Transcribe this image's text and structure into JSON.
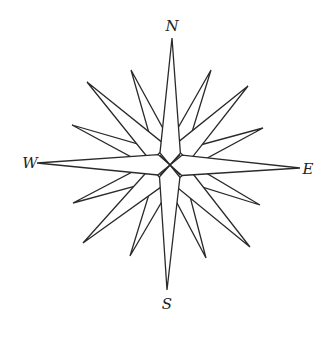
{
  "diagram": {
    "type": "compass-rose",
    "center": [
      170,
      165
    ],
    "labels": {
      "north": "N",
      "south": "S",
      "east": "E",
      "west": "W"
    },
    "label_positions": {
      "north": [
        172,
        31
      ],
      "south": [
        167,
        309
      ],
      "east": [
        308,
        174
      ],
      "west": [
        30,
        168
      ]
    },
    "colors": {
      "stroke": "#2a2a2a",
      "fill": "#ffffff",
      "background": "#ffffff"
    },
    "points": {
      "cardinal": [
        {
          "name": "N",
          "tip": [
            172,
            38
          ]
        },
        {
          "name": "E",
          "tip": [
            300,
            168
          ]
        },
        {
          "name": "S",
          "tip": [
            167,
            290
          ]
        },
        {
          "name": "W",
          "tip": [
            37,
            163
          ]
        }
      ],
      "ordinal": [
        {
          "name": "NE",
          "tip": [
            248,
            86
          ]
        },
        {
          "name": "SE",
          "tip": [
            250,
            247
          ]
        },
        {
          "name": "SW",
          "tip": [
            83,
            243
          ]
        },
        {
          "name": "NW",
          "tip": [
            87,
            82
          ]
        }
      ],
      "secondary": [
        {
          "name": "NNE",
          "tip": [
            211,
            70
          ]
        },
        {
          "name": "ENE",
          "tip": [
            263,
            128
          ]
        },
        {
          "name": "ESE",
          "tip": [
            260,
            205
          ]
        },
        {
          "name": "SSE",
          "tip": [
            206,
            258
          ]
        },
        {
          "name": "SSW",
          "tip": [
            130,
            256
          ]
        },
        {
          "name": "WSW",
          "tip": [
            73,
            203
          ]
        },
        {
          "name": "WNW",
          "tip": [
            72,
            125
          ]
        },
        {
          "name": "NNW",
          "tip": [
            131,
            70
          ]
        }
      ]
    }
  }
}
